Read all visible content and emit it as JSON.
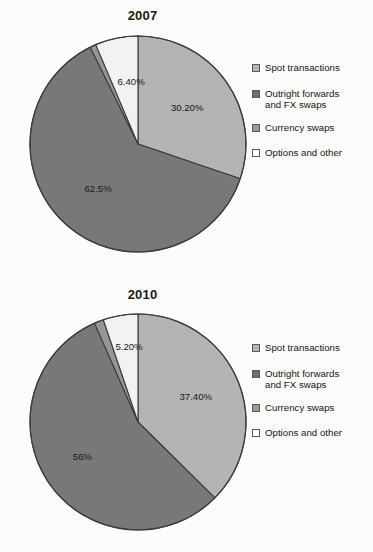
{
  "chart_data": [
    {
      "type": "pie",
      "title": "2007",
      "categories": [
        "Spot transactions",
        "Outright forwards and FX swaps",
        "Currency swaps",
        "Options and other"
      ],
      "values": [
        30.2,
        62.5,
        0.9,
        6.4
      ],
      "data_labels": [
        "30.20%",
        "62.5%",
        "",
        "6.40%"
      ],
      "colors": [
        "#b4b4b4",
        "#787878",
        "#969696",
        "#f2f2f2"
      ],
      "start_angle_deg": 0,
      "direction": "clockwise",
      "legend_position": "right",
      "grid": false,
      "xlabel": "",
      "ylabel": ""
    },
    {
      "type": "pie",
      "title": "2010",
      "categories": [
        "Spot transactions",
        "Outright forwards and FX swaps",
        "Currency swaps",
        "Options and other"
      ],
      "values": [
        37.4,
        56.0,
        1.4,
        5.2
      ],
      "data_labels": [
        "37.40%",
        "56%",
        "",
        "5.20%"
      ],
      "colors": [
        "#b4b4b4",
        "#787878",
        "#969696",
        "#f2f2f2"
      ],
      "start_angle_deg": 0,
      "direction": "clockwise",
      "legend_position": "right",
      "grid": false,
      "xlabel": "",
      "ylabel": ""
    }
  ],
  "charts": [
    {
      "id": "2007",
      "title": "2007",
      "pie": {
        "radius": 108,
        "slices": [
          {
            "name": "spot-transactions",
            "label": "30.20%",
            "value": 30.2,
            "color": "#b4b4b4",
            "label_r": 0.56,
            "label_dx": 0,
            "label_dy": 0
          },
          {
            "name": "outright-forwards",
            "label": "62.5%",
            "value": 62.5,
            "color": "#787878",
            "label_r": 0.56,
            "label_dx": 0,
            "label_dy": 0
          },
          {
            "name": "currency-swaps",
            "label": "",
            "value": 0.9,
            "color": "#969696",
            "label_r": 0.7,
            "label_dx": 0,
            "label_dy": 0
          },
          {
            "name": "options-and-other",
            "label": "6.40%",
            "value": 6.4,
            "color": "#f2f2f2",
            "label_r": 0.6,
            "label_dx": 6,
            "label_dy": 2
          }
        ]
      },
      "legend": [
        {
          "name": "spot-transactions",
          "label": "Spot transactions",
          "color": "#b4b4b4"
        },
        {
          "name": "outright-forwards",
          "label": "Outright forwards\nand FX swaps",
          "color": "#6e6e6e"
        },
        {
          "name": "currency-swaps",
          "label": "Currency swaps",
          "color": "#9b9b9b"
        },
        {
          "name": "options-and-other",
          "label": "Options and other",
          "color": "#ffffff"
        }
      ]
    },
    {
      "id": "2010",
      "title": "2010",
      "pie": {
        "radius": 108,
        "slices": [
          {
            "name": "spot-transactions",
            "label": "37.40%",
            "value": 37.4,
            "color": "#b4b4b4",
            "label_r": 0.58,
            "label_dx": 0,
            "label_dy": 0
          },
          {
            "name": "outright-forwards",
            "label": "56%",
            "value": 56.0,
            "color": "#787878",
            "label_r": 0.58,
            "label_dx": -4,
            "label_dy": 0
          },
          {
            "name": "currency-swaps",
            "label": "",
            "value": 1.4,
            "color": "#969696",
            "label_r": 0.7,
            "label_dx": 0,
            "label_dy": 0
          },
          {
            "name": "options-and-other",
            "label": "5.20%",
            "value": 5.2,
            "color": "#f2f2f2",
            "label_r": 0.74,
            "label_dx": 4,
            "label_dy": 4
          }
        ]
      },
      "legend": [
        {
          "name": "spot-transactions",
          "label": "Spot transactions",
          "color": "#b4b4b4"
        },
        {
          "name": "outright-forwards",
          "label": "Outright forwards\nand FX swaps",
          "color": "#6e6e6e"
        },
        {
          "name": "currency-swaps",
          "label": "Currency swaps",
          "color": "#9b9b9b"
        },
        {
          "name": "options-and-other",
          "label": "Options and other",
          "color": "#ffffff"
        }
      ]
    }
  ],
  "style": {
    "pie_outline": "#3c3c3c",
    "slice_divider": "#3c3c3c",
    "label_color": "#181818",
    "title_color": "#1a1a1a",
    "background": "#fcfcfc"
  }
}
